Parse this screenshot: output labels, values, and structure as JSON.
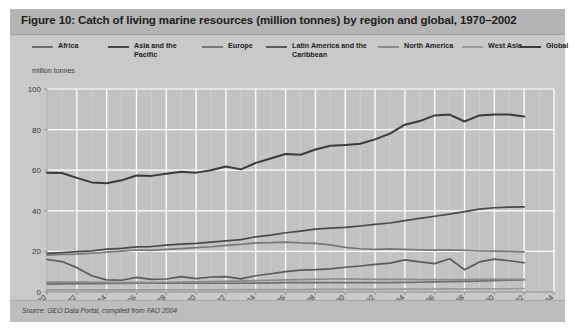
{
  "figure": {
    "title": "Figure 10: Catch of living marine resources (million tonnes) by region and global, 1970–2002",
    "source": "Source:  GEO Data Portal, compiled from FAO 2004",
    "axis_unit_label": "million tonnes"
  },
  "colors": {
    "panel_background": "#c9c9c9",
    "title_background": "#b4b4b4",
    "source_background": "#bdbdbd",
    "plot_background": "#c2c2c2",
    "gridline": "#ffffff",
    "minor_gridline": "#d6d6d6",
    "axis": "#8f8f8f",
    "text": "#1c1c1c"
  },
  "chart_data": {
    "type": "line",
    "title": "Catch of living marine resources (million tonnes) by region and global, 1970–2002",
    "xlabel": "",
    "ylabel": "million tonnes",
    "xlim": [
      1970,
      2004
    ],
    "ylim": [
      0,
      100
    ],
    "ytick_step": 20,
    "yticks": [
      0,
      20,
      40,
      60,
      80,
      100
    ],
    "xticks": [
      1970,
      1972,
      1974,
      1976,
      1978,
      1980,
      1982,
      1984,
      1986,
      1988,
      1990,
      1992,
      1994,
      1996,
      1998,
      2000,
      2002,
      2004
    ],
    "grid": true,
    "legend_position": "top",
    "x": [
      1970,
      1971,
      1972,
      1973,
      1974,
      1975,
      1976,
      1977,
      1978,
      1979,
      1980,
      1981,
      1982,
      1983,
      1984,
      1985,
      1986,
      1987,
      1988,
      1989,
      1990,
      1991,
      1992,
      1993,
      1994,
      1995,
      1996,
      1997,
      1998,
      1999,
      2000,
      2001,
      2002
    ],
    "series": [
      {
        "name": "Africa",
        "color": "#6e6e6e",
        "values": [
          3.9,
          4.0,
          4.1,
          4.1,
          4.2,
          4.2,
          4.3,
          4.3,
          4.3,
          4.3,
          4.3,
          4.3,
          4.3,
          4.3,
          4.4,
          4.5,
          4.6,
          4.6,
          4.6,
          4.6,
          4.6,
          4.6,
          4.6,
          4.6,
          4.7,
          4.8,
          5.0,
          5.1,
          5.2,
          5.4,
          5.6,
          5.8,
          6.0
        ]
      },
      {
        "name": "Asia and the\nPacific",
        "color": "#4a4a4a",
        "values": [
          19.0,
          19.4,
          19.9,
          20.3,
          21.1,
          21.5,
          22.2,
          22.4,
          23.1,
          23.6,
          24.0,
          24.6,
          25.2,
          25.8,
          27.2,
          28.0,
          29.2,
          30.0,
          31.0,
          31.5,
          31.8,
          32.5,
          33.3,
          34.0,
          35.2,
          36.3,
          37.3,
          38.4,
          39.6,
          40.8,
          41.5,
          41.8,
          41.9
        ]
      },
      {
        "name": "Europe",
        "color": "#787878",
        "values": [
          18.2,
          18.5,
          18.7,
          19.1,
          19.6,
          20.1,
          20.7,
          20.5,
          21.0,
          21.4,
          21.9,
          22.3,
          23.0,
          23.5,
          24.2,
          24.3,
          24.6,
          24.2,
          24.0,
          23.2,
          22.0,
          21.3,
          21.0,
          21.2,
          21.0,
          20.8,
          20.6,
          20.8,
          20.5,
          20.2,
          20.1,
          20.0,
          19.8
        ]
      },
      {
        "name": "Latin America and the\nCaribbean",
        "color": "#5a5a5a",
        "values": [
          16.0,
          15.0,
          12.0,
          8.0,
          6.0,
          5.8,
          7.2,
          6.2,
          6.4,
          7.6,
          6.6,
          7.4,
          7.6,
          6.5,
          8.0,
          9.0,
          10.0,
          10.8,
          11.0,
          11.4,
          12.2,
          12.8,
          13.6,
          14.2,
          15.8,
          14.8,
          14.0,
          16.4,
          11.0,
          14.8,
          16.2,
          15.4,
          14.4
        ]
      },
      {
        "name": "North America",
        "color": "#8a8a8a",
        "values": [
          4.9,
          4.9,
          4.9,
          4.8,
          4.7,
          4.6,
          4.7,
          4.6,
          4.8,
          4.9,
          5.0,
          5.1,
          5.3,
          5.4,
          5.6,
          5.8,
          6.0,
          6.1,
          6.2,
          6.4,
          6.4,
          6.3,
          6.2,
          6.2,
          6.2,
          6.1,
          6.1,
          6.1,
          6.1,
          6.2,
          6.2,
          6.2,
          6.2
        ]
      },
      {
        "name": "West Asia",
        "color": "#9a9a9a",
        "values": [
          1.0,
          1.0,
          1.0,
          1.0,
          1.0,
          1.0,
          1.0,
          1.0,
          1.1,
          1.1,
          1.1,
          1.1,
          1.1,
          1.2,
          1.2,
          1.2,
          1.2,
          1.2,
          1.3,
          1.3,
          1.3,
          1.3,
          1.3,
          1.4,
          1.4,
          1.4,
          1.4,
          1.5,
          1.5,
          1.5,
          1.6,
          1.6,
          1.7
        ]
      },
      {
        "name": "Global",
        "color": "#3a3a3a",
        "values": [
          58.8,
          58.6,
          56.2,
          54.0,
          53.6,
          55.0,
          57.4,
          57.2,
          58.2,
          59.2,
          58.8,
          60.0,
          61.8,
          60.4,
          63.6,
          65.8,
          68.0,
          67.6,
          70.2,
          72.0,
          72.4,
          73.0,
          75.2,
          78.0,
          82.4,
          84.2,
          87.0,
          87.4,
          84.0,
          87.0,
          87.4,
          87.4,
          86.4
        ]
      }
    ]
  },
  "legend": [
    {
      "label": "Africa",
      "color": "#6e6e6e",
      "left": 22
    },
    {
      "label": "Asia and the\nPacific",
      "color": "#4a4a4a",
      "left": 98
    },
    {
      "label": "Europe",
      "color": "#787878",
      "left": 192
    },
    {
      "label": "Latin America and the\nCaribbean",
      "color": "#5a5a5a",
      "left": 256
    },
    {
      "label": "North America",
      "color": "#8a8a8a",
      "left": 368
    },
    {
      "label": "West Asia",
      "color": "#9a9a9a",
      "left": 452
    },
    {
      "label": "Global",
      "color": "#3a3a3a",
      "left": 510
    }
  ]
}
